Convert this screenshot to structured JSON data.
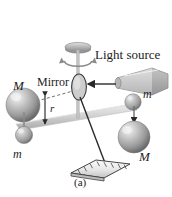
{
  "figure": {
    "caption": "(a)",
    "background_color": "#ffffff",
    "labels": {
      "light_source": "Light source",
      "mirror": "Mirror",
      "mass_large_left": "M",
      "mass_small_left": "m",
      "mass_small_right": "m",
      "mass_large_right": "M",
      "radius": "r"
    },
    "colors": {
      "ink": "#1c1c1c",
      "sphere_dark": "#6e6e6e",
      "sphere_mid": "#9a9a9a",
      "sphere_light": "#d8d8d8",
      "sphere_highlight": "#f0f0f0",
      "rod": "#cfcfcf",
      "fiber": "#b4b4b4",
      "scale_face": "#f2f2f2",
      "beam_line": "#3a3a3a"
    },
    "parts": {
      "torsion_knob": "torsion-head-disc",
      "torsion_fiber": "torsion-fiber",
      "rotation_arrow": "rotation-arrow",
      "mirror_disc": "mirror-disc",
      "light_source_body": "light-source-lamp",
      "light_beam": "light-beam-arrow",
      "reflected_beam": "reflected-beam",
      "scale": "measurement-scale",
      "rod": "torsion-rod",
      "radius_dimension": "radius-dimension-arrow",
      "dashed_axis": "dashed-center-line"
    }
  }
}
